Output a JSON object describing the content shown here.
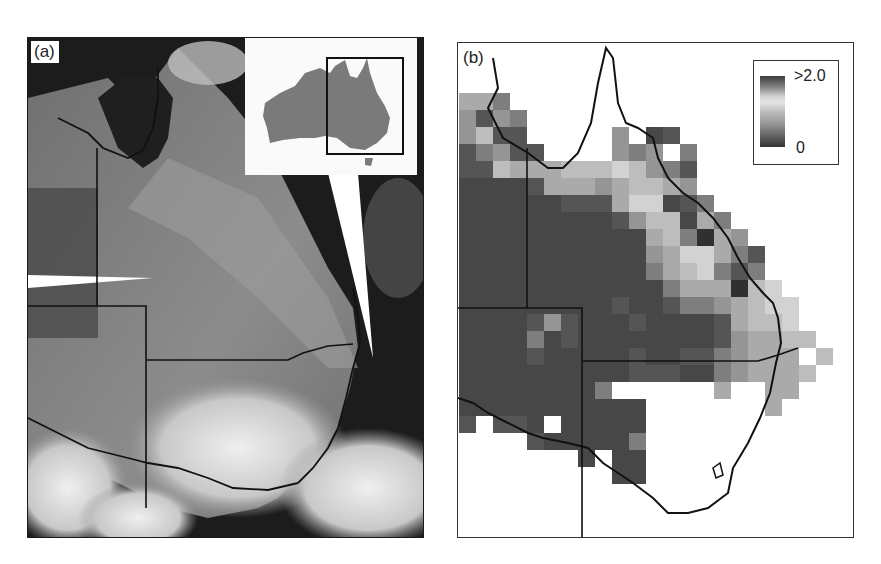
{
  "figure": {
    "panel_a": {
      "label": "(a)",
      "description": "Satellite image of eastern Australia showing dust plume",
      "inset": {
        "description": "Australia locator map with box marking eastern region",
        "land_color": "#7a7a7a",
        "box_color": "#111111"
      }
    },
    "panel_b": {
      "label": "(b)",
      "description": "Gridded map of eastern Australia with grayscale values",
      "legend": {
        "max_label": ">2.0",
        "min_label": "0"
      }
    }
  },
  "chart_data": {
    "type": "heatmap",
    "title": "",
    "legend": {
      "min": "0",
      "max": ">2.0",
      "position": "top-right"
    },
    "grid_origin_px": [
      1,
      50
    ],
    "cell_px": 17,
    "note": "values are grayscale shade levels 0-9 (0=white/no data, 9=darkest); approximate reading of map cells",
    "rows": [
      [
        4,
        4,
        6,
        0,
        0,
        0,
        0,
        0,
        0,
        0,
        0,
        0,
        0,
        0,
        0,
        0,
        0,
        0,
        0,
        0,
        0,
        0,
        0
      ],
      [
        5,
        7,
        5,
        6,
        0,
        0,
        0,
        0,
        0,
        0,
        0,
        0,
        0,
        0,
        0,
        0,
        0,
        0,
        0,
        0,
        0,
        0,
        0
      ],
      [
        5,
        3,
        7,
        7,
        0,
        0,
        0,
        0,
        0,
        5,
        0,
        8,
        7,
        0,
        0,
        0,
        0,
        0,
        0,
        0,
        0,
        0,
        0
      ],
      [
        7,
        6,
        5,
        7,
        7,
        0,
        0,
        0,
        0,
        5,
        6,
        5,
        0,
        6,
        0,
        0,
        0,
        0,
        0,
        0,
        0,
        0,
        0
      ],
      [
        7,
        7,
        3,
        4,
        4,
        4,
        3,
        3,
        3,
        2,
        3,
        5,
        6,
        7,
        0,
        0,
        0,
        0,
        0,
        0,
        0,
        0,
        0
      ],
      [
        8,
        8,
        8,
        8,
        7,
        4,
        4,
        4,
        5,
        4,
        3,
        3,
        4,
        5,
        0,
        0,
        0,
        0,
        0,
        0,
        0,
        0,
        0
      ],
      [
        8,
        8,
        8,
        8,
        8,
        8,
        7,
        7,
        7,
        4,
        2,
        2,
        8,
        7,
        6,
        0,
        0,
        0,
        0,
        0,
        0,
        0,
        0
      ],
      [
        8,
        8,
        8,
        8,
        8,
        8,
        8,
        8,
        8,
        7,
        5,
        3,
        3,
        8,
        4,
        6,
        0,
        0,
        0,
        0,
        0,
        0,
        0
      ],
      [
        8,
        8,
        8,
        8,
        8,
        8,
        8,
        8,
        8,
        8,
        8,
        4,
        3,
        6,
        9,
        4,
        5,
        0,
        0,
        0,
        0,
        0,
        0
      ],
      [
        8,
        8,
        8,
        8,
        8,
        8,
        8,
        8,
        8,
        8,
        8,
        5,
        4,
        2,
        2,
        4,
        6,
        7,
        0,
        0,
        0,
        0,
        0
      ],
      [
        8,
        8,
        8,
        8,
        8,
        8,
        8,
        8,
        8,
        8,
        8,
        6,
        4,
        3,
        2,
        6,
        7,
        6,
        0,
        0,
        0,
        0,
        0
      ],
      [
        8,
        8,
        8,
        8,
        8,
        8,
        8,
        8,
        8,
        8,
        8,
        8,
        6,
        4,
        4,
        4,
        9,
        3,
        2,
        0,
        0,
        0,
        0
      ],
      [
        8,
        8,
        8,
        8,
        8,
        8,
        8,
        8,
        8,
        7,
        8,
        8,
        7,
        6,
        6,
        5,
        4,
        3,
        2,
        2,
        0,
        0,
        0
      ],
      [
        8,
        8,
        8,
        8,
        7,
        5,
        7,
        8,
        8,
        8,
        7,
        8,
        8,
        8,
        8,
        7,
        4,
        3,
        3,
        2,
        0,
        0,
        0
      ],
      [
        8,
        8,
        8,
        8,
        6,
        8,
        7,
        8,
        8,
        8,
        8,
        8,
        8,
        8,
        8,
        7,
        5,
        4,
        4,
        3,
        3,
        0,
        0
      ],
      [
        8,
        8,
        8,
        8,
        7,
        8,
        8,
        8,
        8,
        8,
        7,
        8,
        8,
        7,
        7,
        6,
        5,
        4,
        4,
        4,
        0,
        3,
        0
      ],
      [
        8,
        8,
        8,
        8,
        8,
        8,
        8,
        8,
        8,
        8,
        7,
        7,
        7,
        8,
        8,
        6,
        5,
        4,
        4,
        4,
        3,
        0,
        0
      ],
      [
        8,
        8,
        8,
        8,
        8,
        8,
        8,
        8,
        6,
        0,
        0,
        0,
        0,
        0,
        0,
        4,
        0,
        0,
        4,
        4,
        0,
        0,
        0
      ],
      [
        8,
        8,
        8,
        8,
        8,
        8,
        8,
        8,
        8,
        8,
        8,
        0,
        0,
        0,
        0,
        0,
        0,
        0,
        4,
        0,
        0,
        0,
        0
      ],
      [
        7,
        0,
        7,
        7,
        8,
        0,
        8,
        8,
        8,
        8,
        8,
        0,
        0,
        0,
        0,
        0,
        0,
        0,
        0,
        0,
        0,
        0,
        0
      ],
      [
        0,
        0,
        0,
        0,
        7,
        8,
        8,
        8,
        8,
        8,
        6,
        0,
        0,
        0,
        0,
        0,
        0,
        0,
        0,
        0,
        0,
        0,
        0
      ],
      [
        0,
        0,
        0,
        0,
        0,
        0,
        0,
        8,
        0,
        8,
        8,
        0,
        0,
        0,
        0,
        0,
        0,
        0,
        0,
        0,
        0,
        0,
        0
      ],
      [
        0,
        0,
        0,
        0,
        0,
        0,
        0,
        0,
        0,
        8,
        8,
        0,
        0,
        0,
        0,
        0,
        0,
        0,
        0,
        0,
        0,
        0,
        0
      ]
    ],
    "palette": [
      "#ffffff",
      "#e6e6e6",
      "#d2d2d2",
      "#bdbdbd",
      "#aaaaaa",
      "#959595",
      "#7e7e7e",
      "#555555",
      "#474747",
      "#303030"
    ]
  }
}
